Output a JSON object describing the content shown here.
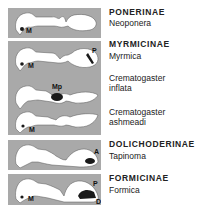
{
  "figure": {
    "panels": [
      {
        "subfamily": "PONERINAE",
        "genera": [
          {
            "name": "Neoponera",
            "markers": [
              "M"
            ]
          }
        ]
      },
      {
        "subfamily": "MYRMICINAE",
        "genera": [
          {
            "name": "Myrmica",
            "markers": [
              "M",
              "P"
            ]
          },
          {
            "name": "Crematogaster inflata",
            "line1": "Crematogaster",
            "line2": "inflata",
            "markers": [
              "Mp"
            ]
          },
          {
            "name": "Crematogaster ashmeadi",
            "line1": "Crematogaster",
            "line2": "ashmeadi",
            "markers": [
              "M"
            ]
          }
        ]
      },
      {
        "subfamily": "DOLICHODERINAE",
        "genera": [
          {
            "name": "Tapinoma",
            "markers": [
              "A"
            ]
          }
        ]
      },
      {
        "subfamily": "FORMICINAE",
        "genera": [
          {
            "name": "Formica",
            "markers": [
              "M",
              "P",
              "D"
            ]
          }
        ]
      }
    ],
    "colors": {
      "panel_bg": "#a9a9a9",
      "body": "#ffffff",
      "gland": "#1a1a1a",
      "text": "#222222"
    }
  }
}
